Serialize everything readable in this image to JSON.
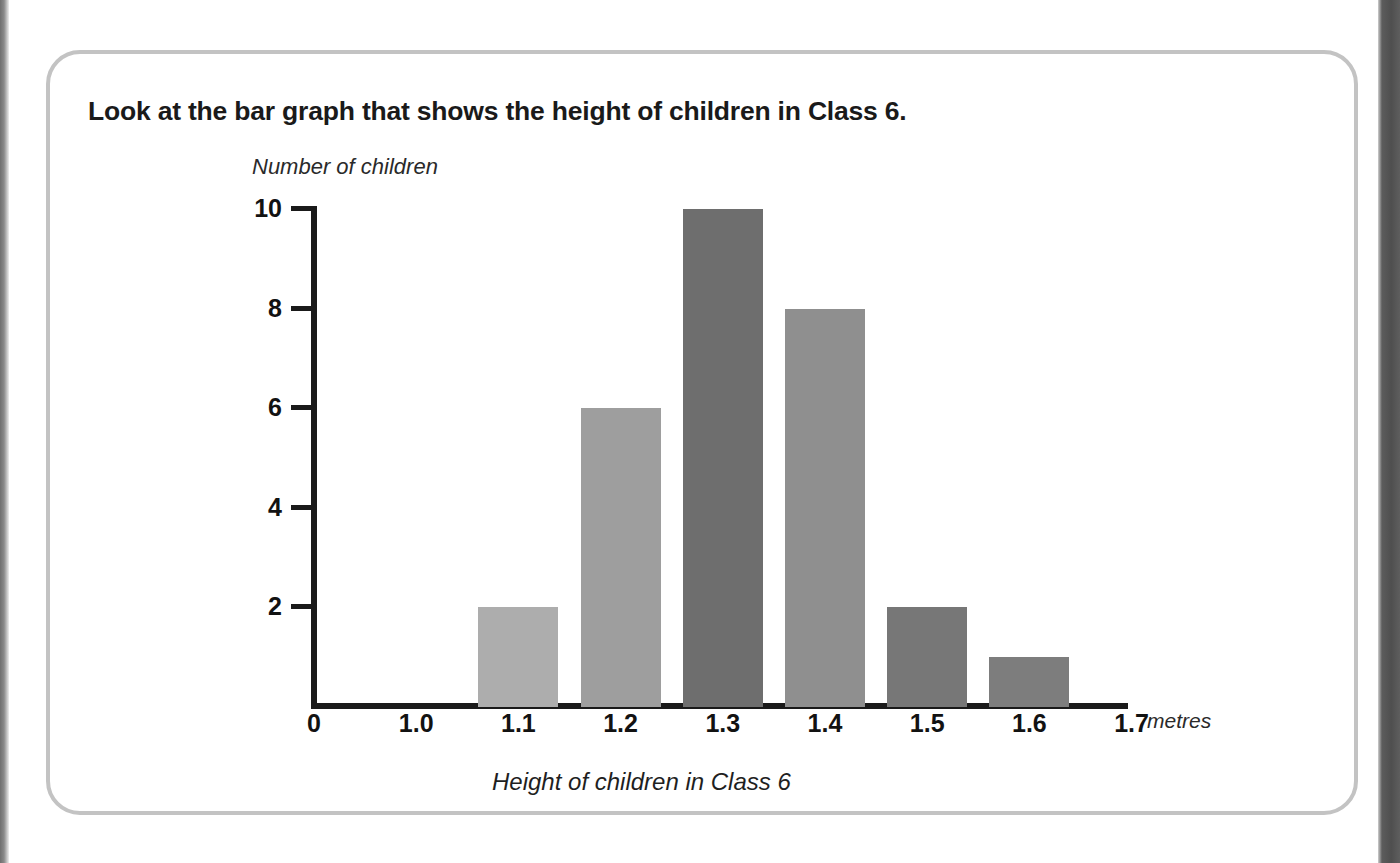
{
  "page": {
    "title": "Look at the bar graph that shows the height of children in Class 6.",
    "card_border_color": "#c3c3c3",
    "background_color": "#ffffff"
  },
  "chart_data": {
    "type": "bar",
    "title": "Look at the bar graph that shows the height of children in Class 6.",
    "xlabel": "Height of children in Class 6",
    "ylabel": "Number of children",
    "x_unit_label": "metres",
    "categories": [
      "1.0",
      "1.1",
      "1.2",
      "1.3",
      "1.4",
      "1.5",
      "1.6",
      "1.7"
    ],
    "values": [
      0,
      2,
      6,
      10,
      8,
      2,
      1,
      0
    ],
    "bars": [
      {
        "category": "1.1",
        "value": 2,
        "color": "#adadad"
      },
      {
        "category": "1.2",
        "value": 6,
        "color": "#9e9e9e"
      },
      {
        "category": "1.3",
        "value": 10,
        "color": "#6e6e6e"
      },
      {
        "category": "1.4",
        "value": 8,
        "color": "#8f8f8f"
      },
      {
        "category": "1.5",
        "value": 2,
        "color": "#777777"
      },
      {
        "category": "1.6",
        "value": 1,
        "color": "#7d7d7d"
      }
    ],
    "x_tick_labels": [
      "0",
      "1.0",
      "1.1",
      "1.2",
      "1.3",
      "1.4",
      "1.5",
      "1.6",
      "1.7"
    ],
    "y_tick_labels": [
      "10",
      "8",
      "6",
      "4",
      "2"
    ],
    "y_origin_label": "0",
    "ylim": [
      0,
      10
    ],
    "y_tick_step": 2,
    "grid": false,
    "legend": false,
    "axis_color": "#1a1a1a"
  }
}
